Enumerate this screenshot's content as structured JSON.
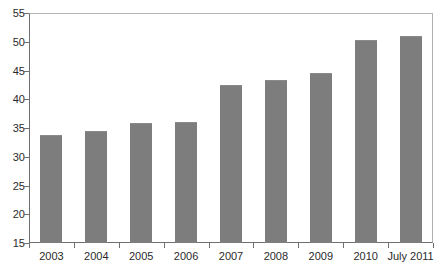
{
  "figure": {
    "clipped_header_text": "",
    "background_color": "#ffffff",
    "bar_color": "#7d7d7d",
    "axis_color": "#6f6f6f",
    "text_color": "#2b2b2b"
  },
  "chart_data": {
    "type": "bar",
    "title": "",
    "xlabel": "",
    "ylabel": "",
    "categories": [
      "2003",
      "2004",
      "2005",
      "2006",
      "2007",
      "2008",
      "2009",
      "2010",
      "July 2011"
    ],
    "values": [
      33.8,
      34.5,
      35.9,
      36.0,
      42.5,
      43.3,
      44.5,
      50.3,
      51.0
    ],
    "ylim": [
      15,
      55
    ],
    "yticks": [
      15,
      20,
      25,
      30,
      35,
      40,
      45,
      50,
      55
    ],
    "ytick_labels": [
      "15",
      "20",
      "25",
      "30",
      "35",
      "40",
      "45",
      "50",
      "55"
    ],
    "grid": false,
    "legend": null,
    "bar_color": "#7d7d7d",
    "series": [
      {
        "name": "value",
        "values": [
          33.8,
          34.5,
          35.9,
          36.0,
          42.5,
          43.3,
          44.5,
          50.3,
          51.0
        ]
      }
    ]
  }
}
